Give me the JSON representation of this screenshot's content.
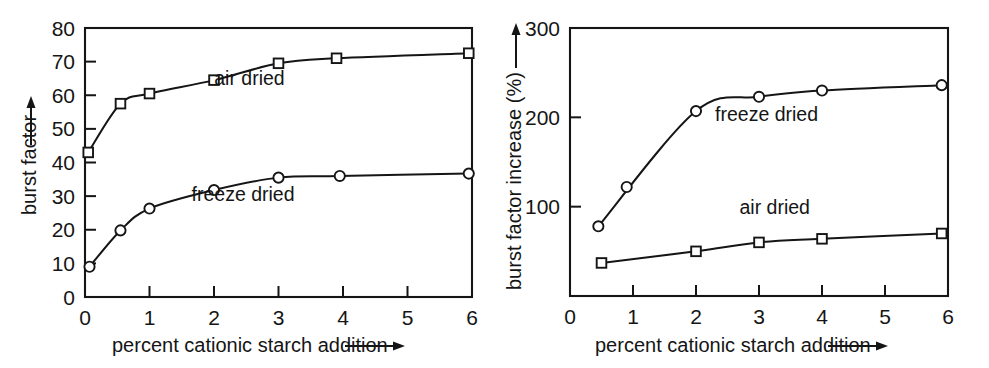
{
  "figure": {
    "background": "#ffffff",
    "ink_color": "#151515",
    "panel_count": 2
  },
  "chart_data": [
    {
      "type": "scatter",
      "panel": "left",
      "title": "",
      "xlabel": "percent cationic starch addition",
      "ylabel": "burst factor",
      "xlim": [
        0,
        6
      ],
      "ylim": [
        0,
        80
      ],
      "xticks": [
        0,
        1,
        2,
        3,
        4,
        5,
        6
      ],
      "xticklabels": [
        "0",
        "1",
        "2",
        "3",
        "4",
        "5",
        "6"
      ],
      "yticks": [
        0,
        10,
        20,
        30,
        40,
        50,
        60,
        70,
        80
      ],
      "yticklabels": [
        "0",
        "10",
        "20",
        "30",
        "40",
        "50",
        "60",
        "70",
        "80"
      ],
      "grid": false,
      "legend_position": "in-plot annotations",
      "xlabel_arrow": true,
      "ylabel_arrow": true,
      "series": [
        {
          "name": "air dried",
          "marker": "square",
          "annotation": "air dried",
          "annotation_x": 2.55,
          "annotation_y": 63.0,
          "x": [
            0.05,
            0.55,
            1.0,
            2.0,
            3.0,
            3.9,
            5.95
          ],
          "values": [
            43.0,
            57.5,
            60.5,
            64.5,
            69.5,
            71.0,
            72.5
          ]
        },
        {
          "name": "freeze dried",
          "marker": "circle",
          "annotation": "freeze dried",
          "annotation_x": 2.45,
          "annotation_y": 28.5,
          "x": [
            0.07,
            0.55,
            1.0,
            2.0,
            3.0,
            3.95,
            5.95
          ],
          "values": [
            9.0,
            19.8,
            26.3,
            31.8,
            35.5,
            36.0,
            36.7
          ]
        }
      ]
    },
    {
      "type": "scatter",
      "panel": "right",
      "title": "",
      "xlabel": "percent cationic starch addition",
      "ylabel": "burst factor increase (%)",
      "xlim": [
        0,
        6
      ],
      "ylim": [
        0,
        300
      ],
      "xticks": [
        0,
        1,
        2,
        3,
        4,
        5,
        6
      ],
      "xticklabels": [
        "0",
        "1",
        "2",
        "3",
        "4",
        "5",
        "6"
      ],
      "yticks": [
        100,
        200,
        300
      ],
      "yticklabels": [
        "100",
        "200",
        "300"
      ],
      "grid": false,
      "legend_position": "in-plot annotations",
      "xlabel_arrow": true,
      "ylabel_arrow": true,
      "series": [
        {
          "name": "freeze dried",
          "marker": "circle",
          "annotation": "freeze dried",
          "annotation_x": 3.12,
          "annotation_y": 196.0,
          "x": [
            0.45,
            0.9,
            2.0,
            3.0,
            4.0,
            5.9
          ],
          "values": [
            78.0,
            122.0,
            207.0,
            223.0,
            230.0,
            236.0
          ]
        },
        {
          "name": "air dried",
          "marker": "square",
          "annotation": "air dried",
          "annotation_x": 3.25,
          "annotation_y": 92.0,
          "x": [
            0.5,
            2.0,
            3.0,
            4.0,
            5.9
          ],
          "values": [
            37.0,
            50.0,
            60.0,
            64.0,
            70.0
          ]
        }
      ]
    }
  ]
}
